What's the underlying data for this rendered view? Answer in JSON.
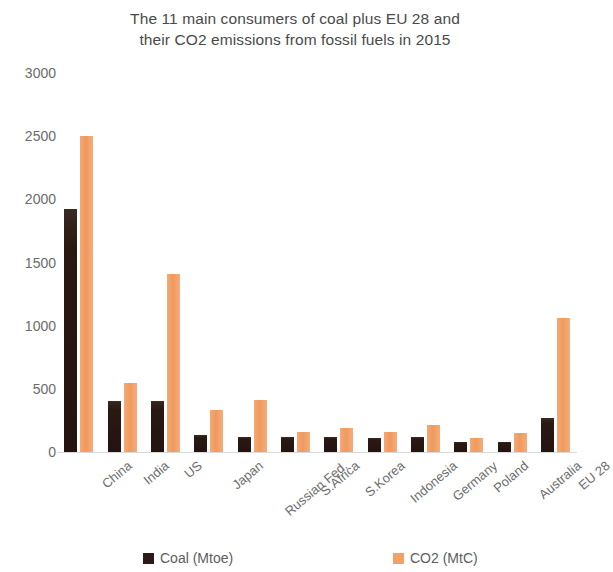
{
  "chart_data": {
    "type": "bar",
    "title": "The 11 main consumers of coal plus EU 28  and their CO2 emissions from fossil fuels in 2015",
    "title_lines": [
      "The 11 main consumers of coal plus EU 28  and",
      "their CO2 emissions from fossil fuels in 2015"
    ],
    "xlabel": "",
    "ylabel": "",
    "ylim": [
      0,
      3000
    ],
    "ytick_values": [
      3000,
      2500,
      2000,
      1500,
      1000,
      500,
      0
    ],
    "ytick_labels": [
      "3000",
      "2500",
      "2000",
      "1500",
      "1000",
      "500",
      "0"
    ],
    "grid": false,
    "legend_position": "bottom",
    "categories": [
      "China",
      "India",
      "US",
      "Japan",
      "Russian Fed.",
      "S.Africa",
      "S.Korea",
      "Indonesia",
      "Germany",
      "Poland",
      "Australia",
      "EU 28"
    ],
    "series": [
      {
        "name": "Coal (Mtoe)",
        "color": "#2b1a15",
        "values": [
          1920,
          400,
          400,
          135,
          120,
          120,
          120,
          110,
          120,
          80,
          80,
          270
        ]
      },
      {
        "name": "CO2 (MtC)",
        "color": "#f2a268",
        "values": [
          2500,
          550,
          1410,
          330,
          410,
          160,
          190,
          160,
          215,
          110,
          150,
          1060
        ]
      }
    ]
  },
  "legend": {
    "items": [
      {
        "label": "Coal (Mtoe)",
        "color": "#2b1a15"
      },
      {
        "label": "CO2 (MtC)",
        "color": "#f2a268"
      }
    ]
  }
}
